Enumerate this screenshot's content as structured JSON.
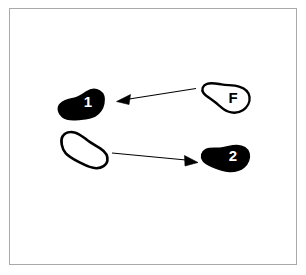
{
  "figure": {
    "title": "Footstep movement diagram",
    "background_color": "#ffffff",
    "frame": {
      "border_color": "#a9a9a9",
      "border_width_px": 1,
      "x": 9,
      "y": 8,
      "width": 288,
      "height": 257
    },
    "ink_color": "#000000",
    "label_on_filled_color": "#ffffff",
    "label_on_outline_color": "#000000"
  },
  "footprints": [
    {
      "id": "footprint-1",
      "label": "1",
      "style": "filled",
      "fill": "#000000",
      "stroke": "#000000",
      "label_color": "#ffffff",
      "position": {
        "x": 57,
        "y": 89,
        "width": 48,
        "height": 33
      },
      "label_position": {
        "x": 88,
        "y": 103
      }
    },
    {
      "id": "footprint-f",
      "label": "F",
      "style": "outline",
      "fill": "#ffffff",
      "stroke": "#000000",
      "label_color": "#000000",
      "position": {
        "x": 200,
        "y": 82,
        "width": 50,
        "height": 32
      },
      "label_position": {
        "x": 233,
        "y": 99
      }
    },
    {
      "id": "footprint-start",
      "label": "",
      "style": "outline",
      "fill": "#ffffff",
      "stroke": "#000000",
      "label_color": "#000000",
      "position": {
        "x": 58,
        "y": 131,
        "width": 50,
        "height": 33
      },
      "label_position": null
    },
    {
      "id": "footprint-2",
      "label": "2",
      "style": "filled",
      "fill": "#000000",
      "stroke": "#000000",
      "label_color": "#ffffff",
      "position": {
        "x": 200,
        "y": 143,
        "width": 50,
        "height": 32
      },
      "label_position": {
        "x": 233,
        "y": 157
      }
    }
  ],
  "arrows": [
    {
      "id": "arrow-f-to-1",
      "direction": "left",
      "from": "footprint-f",
      "to": "footprint-1",
      "start": {
        "x": 196,
        "y": 88
      },
      "end": {
        "x": 117,
        "y": 101
      },
      "color": "#000000"
    },
    {
      "id": "arrow-start-to-2",
      "direction": "right",
      "from": "footprint-start",
      "to": "footprint-2",
      "start": {
        "x": 112,
        "y": 153
      },
      "end": {
        "x": 198,
        "y": 162
      },
      "color": "#000000"
    }
  ]
}
